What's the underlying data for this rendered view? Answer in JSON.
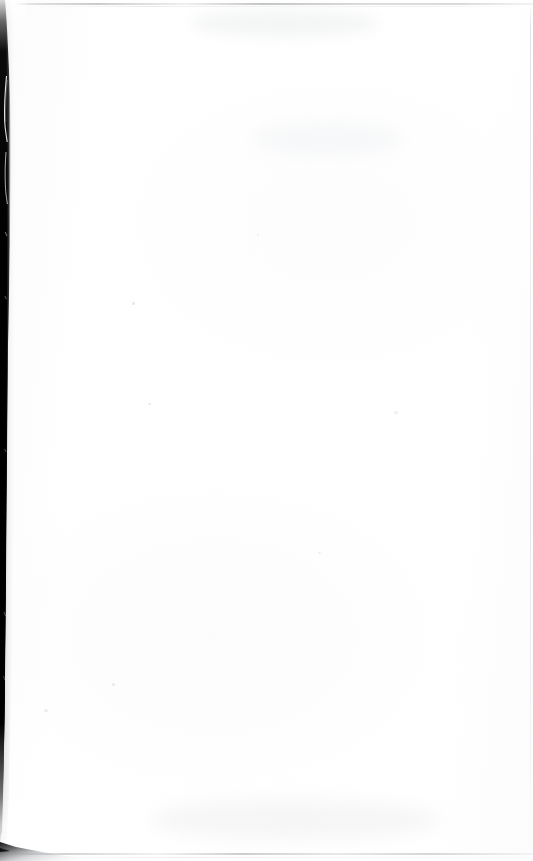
{
  "document": {
    "kind": "scanned-page",
    "title": "Scanned Blank Page",
    "page_text": "",
    "visible_text_content": "",
    "page_width_px": 533,
    "page_height_px": 861
  },
  "colors": {
    "paper": "#ffffff",
    "paper_tint": "#fcfcfd",
    "gutter_black": "#000000",
    "gutter_core": "#050505",
    "gutter_edge_gray": "#8a8d92",
    "scanline_gray": "#8e9196",
    "scanline_light_gray": "#bec0c4",
    "speck_gray": "#c6c8cb",
    "scratch_white": "#ffffff"
  },
  "artifacts": {
    "gutter": {
      "name": "left-binding-shadow",
      "side": "left",
      "top_px": 0,
      "bottom_px": 812,
      "max_width_px": 11,
      "min_width_px": 2,
      "description": "Dark vertical binding gutter shadow along the left edge, widest near the upper third and tapering to nothing toward the bottom."
    },
    "scratches": [
      {
        "name": "hairline-scratch-upper",
        "top_px": 78,
        "height_px": 62,
        "description": "White hairline scratch curving through the black gutter band."
      },
      {
        "name": "hairline-scratch-mid",
        "top_px": 148,
        "height_px": 46,
        "description": "Second shorter white scratch lower in the gutter band."
      }
    ],
    "scanlines": [
      {
        "name": "scanline-top",
        "top_px": 3,
        "orientation": "horizontal"
      },
      {
        "name": "scanline-bottom",
        "top_px": 853,
        "orientation": "horizontal"
      },
      {
        "name": "scanline-right",
        "left_px": 530,
        "orientation": "vertical"
      }
    ],
    "corner_wedge": {
      "name": "bottom-left-corner-wedge",
      "left_px": 0,
      "top_px": 836,
      "width_px": 118,
      "height_px": 25,
      "description": "Small dark triangular wedge of page-edge shadow at the bottom-left corner."
    }
  }
}
